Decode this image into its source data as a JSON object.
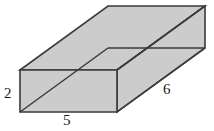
{
  "figure": {
    "kind": "rectangular-prism",
    "projection": "oblique",
    "colors": {
      "face_fill": "#cccccc",
      "edge_stroke": "#3a3a3a",
      "label_color": "#1a1a1a",
      "background": "#ffffff"
    },
    "labels": {
      "height": "2",
      "width": "5",
      "depth": "6"
    },
    "geometry": {
      "front_bottom_left": [
        20,
        112
      ],
      "front_bottom_right": [
        117,
        112
      ],
      "front_top_left": [
        20,
        70
      ],
      "front_top_right": [
        117,
        70
      ],
      "back_bottom_left": [
        108,
        48
      ],
      "back_bottom_right": [
        205,
        48
      ],
      "back_top_left": [
        108,
        6
      ],
      "back_top_right": [
        205,
        6
      ]
    }
  }
}
